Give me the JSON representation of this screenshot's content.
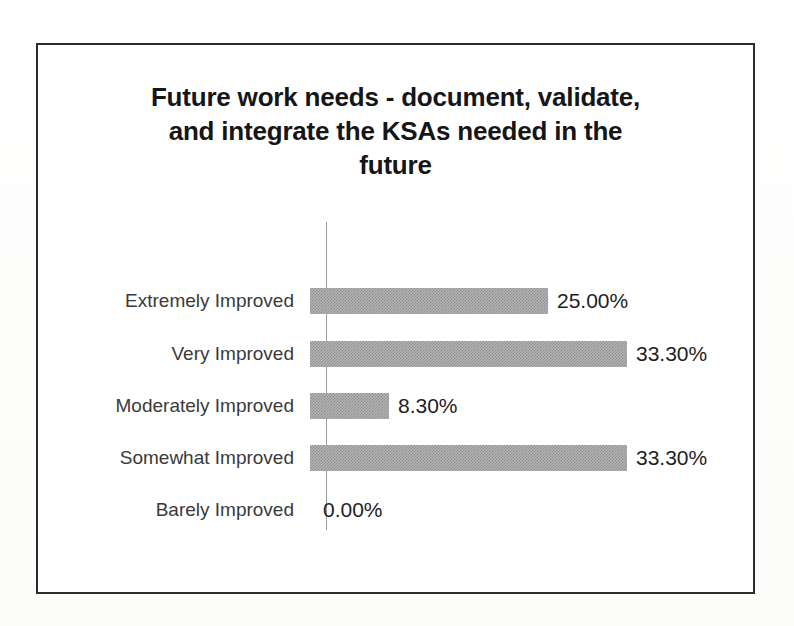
{
  "page": {
    "background_color": "#fdfdfd",
    "width": 794,
    "height": 626
  },
  "chart_frame": {
    "border_color": "#2b2b2b",
    "background_color": "#ffffff"
  },
  "title": {
    "text": "Future work needs - document, validate,\nand integrate the KSAs needed in the\nfuture",
    "line1": "Future work needs - document, validate,",
    "line2": "and integrate the KSAs needed in the",
    "line3": "future",
    "color": "#161616"
  },
  "axis": {
    "category_axis_line_color": "#9a9a9a",
    "value_axis_visible": false,
    "gridlines": false,
    "tick_labels_visible": false
  },
  "style": {
    "bar_fill_color": "#b4b4b4",
    "bar_pattern": "50-percent-dither-checkerboard",
    "category_label_color": "#3a3a3a",
    "value_label_color": "#1e1e1e"
  },
  "rows": [
    {
      "label": "Extremely Improved",
      "value_label": "25.00%",
      "value": 25.0,
      "bar_width_px": 238,
      "zero": false
    },
    {
      "label": "Very Improved",
      "value_label": "33.30%",
      "value": 33.3,
      "bar_width_px": 317,
      "zero": false
    },
    {
      "label": "Moderately Improved",
      "value_label": "8.30%",
      "value": 8.3,
      "bar_width_px": 79,
      "zero": false
    },
    {
      "label": "Somewhat Improved",
      "value_label": "33.30%",
      "value": 33.3,
      "bar_width_px": 317,
      "zero": false
    },
    {
      "label": "Barely Improved",
      "value_label": "0.00%",
      "value": 0.0,
      "bar_width_px": 0,
      "zero": true
    }
  ],
  "chart_data": {
    "type": "bar",
    "orientation": "horizontal",
    "title": "Future work needs - document, validate, and integrate the KSAs needed in the future",
    "xlabel": "",
    "ylabel": "",
    "categories": [
      "Extremely Improved",
      "Very Improved",
      "Moderately Improved",
      "Somewhat Improved",
      "Barely Improved"
    ],
    "values": [
      25.0,
      33.3,
      8.3,
      33.3,
      0.0
    ],
    "value_labels": [
      "25.00%",
      "33.30%",
      "8.30%",
      "33.30%",
      "0.00%"
    ],
    "units": "percent",
    "xlim": [
      0,
      35
    ],
    "grid": false,
    "legend": false,
    "data_labels": true,
    "series": [
      {
        "name": "",
        "values": [
          25.0,
          33.3,
          8.3,
          33.3,
          0.0
        ]
      }
    ]
  }
}
